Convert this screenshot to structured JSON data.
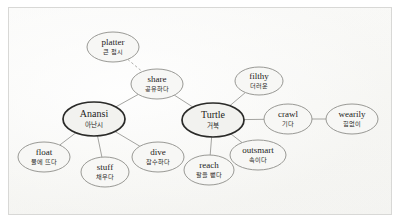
{
  "diagram": {
    "background_color": "#fafaf9",
    "frame_color": "#d8d8d6",
    "node_fill": "#f7f7f5",
    "node_stroke": "#8d8d89",
    "main_node_stroke": "#2a2a28",
    "edge_color": "#9a9a96"
  },
  "nodes": [
    {
      "id": "platter",
      "en": "platter",
      "ko": "큰 접시",
      "cx": 113,
      "cy": 47,
      "rx": 26,
      "ry": 15,
      "main": false
    },
    {
      "id": "share",
      "en": "share",
      "ko": "공유하다",
      "cx": 157,
      "cy": 84,
      "rx": 26,
      "ry": 15,
      "main": false
    },
    {
      "id": "filthy",
      "en": "filthy",
      "ko": "더러운",
      "cx": 259,
      "cy": 81,
      "rx": 24,
      "ry": 14,
      "main": false
    },
    {
      "id": "anansi",
      "en": "Anansi",
      "ko": "아난시",
      "cx": 94,
      "cy": 119,
      "rx": 31,
      "ry": 17,
      "main": true
    },
    {
      "id": "turtle",
      "en": "Turtle",
      "ko": "거북",
      "cx": 213,
      "cy": 120,
      "rx": 31,
      "ry": 17,
      "main": true
    },
    {
      "id": "crawl",
      "en": "crawl",
      "ko": "기다",
      "cx": 288,
      "cy": 119,
      "rx": 24,
      "ry": 15,
      "main": false
    },
    {
      "id": "wearily",
      "en": "wearily",
      "ko": "힘없이",
      "cx": 352,
      "cy": 119,
      "rx": 26,
      "ry": 15,
      "main": false
    },
    {
      "id": "float",
      "en": "float",
      "ko": "물에 뜨다",
      "cx": 44,
      "cy": 157,
      "rx": 26,
      "ry": 15,
      "main": false
    },
    {
      "id": "stuff",
      "en": "stuff",
      "ko": "채우다",
      "cx": 105,
      "cy": 172,
      "rx": 24,
      "ry": 15,
      "main": false
    },
    {
      "id": "dive",
      "en": "dive",
      "ko": "잠수하다",
      "cx": 158,
      "cy": 157,
      "rx": 26,
      "ry": 15,
      "main": false
    },
    {
      "id": "reach",
      "en": "reach",
      "ko": "팔을 뻗다",
      "cx": 209,
      "cy": 170,
      "rx": 25,
      "ry": 15,
      "main": false
    },
    {
      "id": "outsmart",
      "en": "outsmart",
      "ko": "속이다",
      "cx": 258,
      "cy": 155,
      "rx": 28,
      "ry": 15,
      "main": false
    }
  ],
  "edges": [
    {
      "from": "platter",
      "to": "share",
      "style": "dashed"
    },
    {
      "from": "share",
      "to": "anansi",
      "style": "solid"
    },
    {
      "from": "share",
      "to": "turtle",
      "style": "solid"
    },
    {
      "from": "anansi",
      "to": "float",
      "style": "solid"
    },
    {
      "from": "anansi",
      "to": "stuff",
      "style": "solid"
    },
    {
      "from": "anansi",
      "to": "dive",
      "style": "solid"
    },
    {
      "from": "turtle",
      "to": "filthy",
      "style": "solid"
    },
    {
      "from": "turtle",
      "to": "crawl",
      "style": "solid"
    },
    {
      "from": "turtle",
      "to": "reach",
      "style": "solid"
    },
    {
      "from": "turtle",
      "to": "outsmart",
      "style": "solid"
    },
    {
      "from": "crawl",
      "to": "wearily",
      "style": "solid"
    }
  ]
}
